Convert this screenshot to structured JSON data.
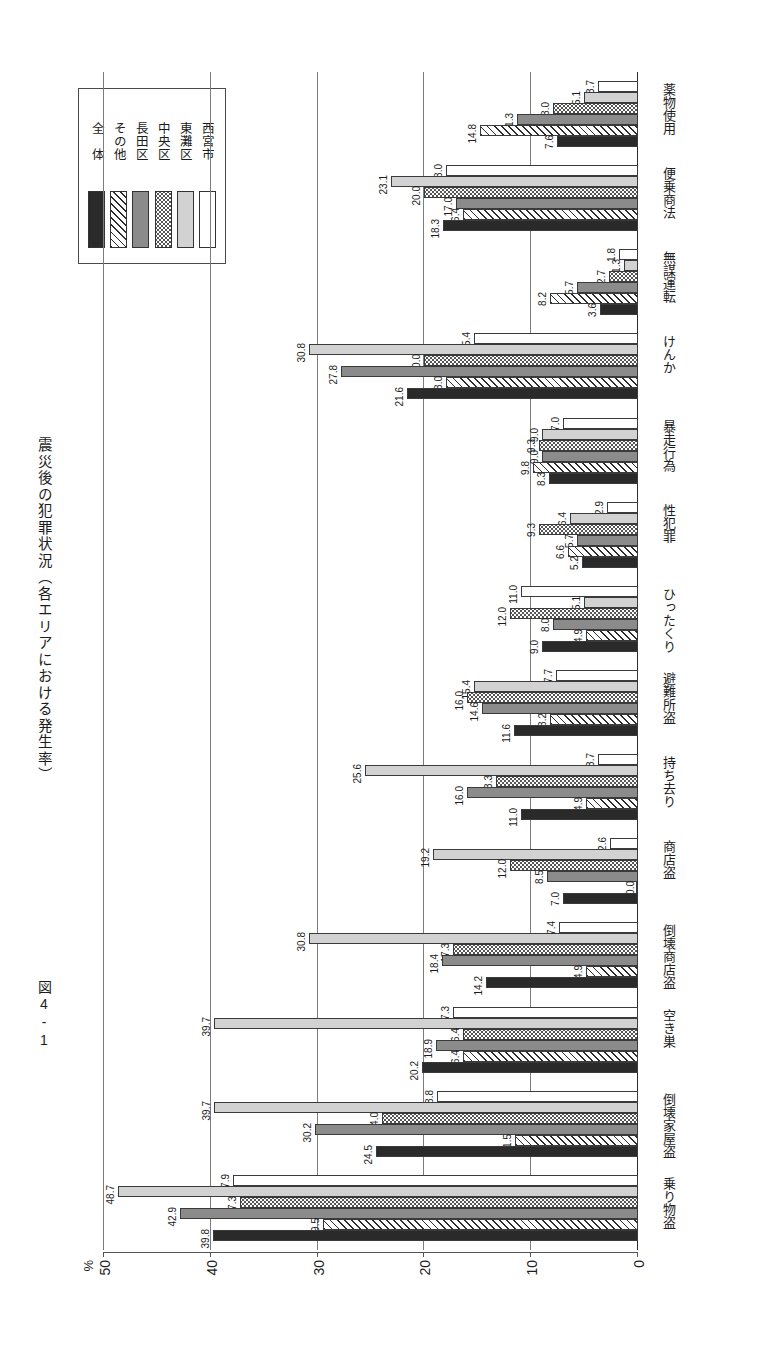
{
  "figure": {
    "number": "図4-1",
    "title": "震災後の犯罪状況（各エリアにおける発生率）"
  },
  "legend": {
    "items": [
      {
        "label": "西宮市",
        "fill": "f-white"
      },
      {
        "label": "東灘区",
        "fill": "f-ltgray"
      },
      {
        "label": "中央区",
        "fill": "f-dots"
      },
      {
        "label": "長田区",
        "fill": "f-dkgray"
      },
      {
        "label": "その他",
        "fill": "f-hatch"
      },
      {
        "label": "全　体",
        "fill": "f-black"
      }
    ]
  },
  "axis": {
    "unit": "%",
    "ticks": [
      "50",
      "40",
      "30",
      "20",
      "10",
      "0"
    ],
    "tick_values": [
      50,
      40,
      30,
      20,
      10,
      0
    ]
  },
  "chart_data": {
    "type": "bar",
    "orientation": "horizontal",
    "title": "震災後の犯罪状況（各エリアにおける発生率）",
    "xlabel": "",
    "ylabel": "%",
    "ylim": [
      0,
      50
    ],
    "grid": true,
    "legend_position": "top-left",
    "categories": [
      "薬物使用",
      "便乗商法",
      "無謀運転",
      "けんか",
      "暴走行為",
      "性犯罪",
      "ひったくり",
      "避難所盗",
      "持ち去り",
      "商店盗",
      "倒壊商店盗",
      "空き巣",
      "倒壊家屋盗",
      "乗り物盗"
    ],
    "series": [
      {
        "name": "西宮市",
        "fill": "f-white",
        "values": [
          3.7,
          18.0,
          1.8,
          15.4,
          7.0,
          2.9,
          11.0,
          7.7,
          3.7,
          2.6,
          7.4,
          17.3,
          18.8,
          37.9
        ]
      },
      {
        "name": "東灘区",
        "fill": "f-ltgray",
        "values": [
          5.1,
          23.1,
          1.3,
          30.8,
          9.0,
          6.4,
          5.1,
          15.4,
          25.6,
          19.2,
          30.8,
          39.7,
          39.7,
          48.7
        ]
      },
      {
        "name": "中央区",
        "fill": "f-dots",
        "values": [
          8.0,
          20.0,
          2.7,
          20.0,
          9.3,
          9.3,
          12.0,
          16.0,
          13.3,
          12.0,
          17.3,
          16.4,
          24.0,
          37.3
        ]
      },
      {
        "name": "長田区",
        "fill": "f-dkgray",
        "values": [
          11.3,
          17.0,
          5.7,
          27.8,
          9.0,
          5.7,
          8.0,
          14.6,
          16.0,
          8.5,
          18.4,
          18.9,
          30.2,
          42.9
        ]
      },
      {
        "name": "その他",
        "fill": "f-hatch",
        "values": [
          14.8,
          16.4,
          8.2,
          18.0,
          9.8,
          6.6,
          4.9,
          8.2,
          4.9,
          0.0,
          4.9,
          16.4,
          11.5,
          29.5
        ]
      },
      {
        "name": "全　体",
        "fill": "f-black",
        "values": [
          7.6,
          18.3,
          3.6,
          21.6,
          8.3,
          5.2,
          9.0,
          11.6,
          11.0,
          7.0,
          14.2,
          20.2,
          24.5,
          39.8
        ]
      }
    ]
  }
}
